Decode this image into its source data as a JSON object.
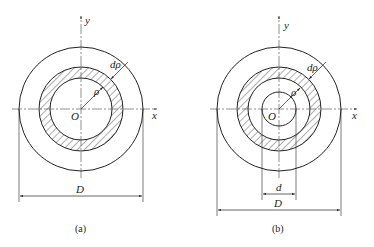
{
  "figures": [
    {
      "id": "a",
      "caption": "(a)",
      "labels": {
        "y_axis": "y",
        "x_axis": "x",
        "origin": "O",
        "radius": "ρ",
        "thickness": "dρ",
        "outer_diameter": "D"
      },
      "description": "Solid circular cross-section with hatched thin ring of radius ρ and thickness dρ"
    },
    {
      "id": "b",
      "caption": "(b)",
      "labels": {
        "y_axis": "y",
        "x_axis": "x",
        "origin": "O",
        "radius": "ρ",
        "thickness": "dρ",
        "inner_diameter": "d",
        "outer_diameter": "D"
      },
      "description": "Hollow circular cross-section with inner diameter d, outer diameter D, hatched thin ring of radius ρ and thickness dρ"
    }
  ],
  "colors": {
    "stroke": "#222222",
    "background": "#ffffff"
  }
}
